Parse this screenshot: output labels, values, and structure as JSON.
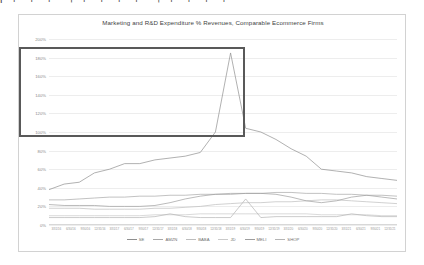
{
  "top_strip": {
    "text": "l ⌐ ⌐ ⌐  ¬ ⌐ ⌐ ⌐ ⌐ ¬ ⌐  ⌐ ⌐ ⌐"
  },
  "card": {
    "border_color": "#d2d2d2"
  },
  "highlight": {
    "name": "highlight-rectangle",
    "color": "#595959"
  },
  "legend": {
    "position": "bottom-center",
    "entries": [
      {
        "label": "SE",
        "color": "#9a9a9a"
      },
      {
        "label": "AMZN",
        "color": "#a8a8a8"
      },
      {
        "label": "BABA",
        "color": "#b4b4b4"
      },
      {
        "label": "JD",
        "color": "#c2c2c2"
      },
      {
        "label": "MELI",
        "color": "#9e9e9e"
      },
      {
        "label": "SHOP",
        "color": "#b0b0b0"
      }
    ]
  },
  "chart_data": {
    "type": "line",
    "title": "Marketing and R&D Expenditure % Revenues, Comparable Ecommerce Firms",
    "xlabel": "",
    "ylabel": "",
    "ylim": [
      0,
      200
    ],
    "ytick_labels": [
      "0%",
      "20%",
      "40%",
      "60%",
      "80%",
      "100%",
      "120%",
      "140%",
      "160%",
      "180%",
      "200%"
    ],
    "ytick_values": [
      0,
      20,
      40,
      60,
      80,
      100,
      120,
      140,
      160,
      180,
      200
    ],
    "grid": true,
    "legend_position": "bottom",
    "categories": [
      "3/31/16",
      "6/30/16",
      "9/30/16",
      "12/31/16",
      "3/31/17",
      "6/30/17",
      "9/30/17",
      "12/31/17",
      "3/31/18",
      "6/30/18",
      "9/30/18",
      "12/31/18",
      "3/31/19",
      "6/30/19",
      "9/30/19",
      "12/31/19",
      "3/31/20",
      "6/30/20",
      "9/30/20",
      "12/31/20",
      "3/31/21",
      "6/30/21",
      "9/30/21",
      "12/31/21"
    ],
    "series": [
      {
        "name": "SE",
        "color": "#8f8f8f",
        "values": [
          38,
          44,
          46,
          56,
          60,
          66,
          66,
          70,
          72,
          74,
          78,
          100,
          185,
          104,
          100,
          92,
          82,
          74,
          60,
          58,
          56,
          52,
          50,
          48
        ]
      },
      {
        "name": "AMZN",
        "color": "#a8a8a8",
        "values": [
          27,
          27,
          28,
          29,
          30,
          30,
          31,
          31,
          32,
          32,
          33,
          33,
          34,
          34,
          34,
          35,
          35,
          34,
          34,
          33,
          33,
          32,
          32,
          31
        ]
      },
      {
        "name": "BABA",
        "color": "#bdbdbd",
        "values": [
          18,
          18,
          18,
          17,
          17,
          17,
          17,
          18,
          18,
          19,
          20,
          22,
          23,
          24,
          24,
          25,
          25,
          26,
          27,
          27,
          26,
          25,
          24,
          23
        ]
      },
      {
        "name": "JD",
        "color": "#cacaca",
        "values": [
          10,
          10,
          10,
          10,
          10,
          10,
          10,
          11,
          11,
          11,
          12,
          12,
          12,
          12,
          12,
          12,
          12,
          12,
          11,
          11,
          11,
          11,
          10,
          10
        ]
      },
      {
        "name": "MELI",
        "color": "#9e9e9e",
        "values": [
          22,
          21,
          21,
          21,
          20,
          20,
          20,
          21,
          24,
          28,
          31,
          33,
          33,
          34,
          34,
          33,
          30,
          26,
          24,
          26,
          30,
          32,
          30,
          28
        ]
      },
      {
        "name": "SHOP",
        "color": "#b5b5b5",
        "values": [
          8,
          8,
          8,
          8,
          8,
          8,
          8,
          9,
          12,
          9,
          8,
          8,
          8,
          28,
          8,
          9,
          9,
          9,
          9,
          9,
          12,
          10,
          9,
          9
        ]
      }
    ]
  }
}
